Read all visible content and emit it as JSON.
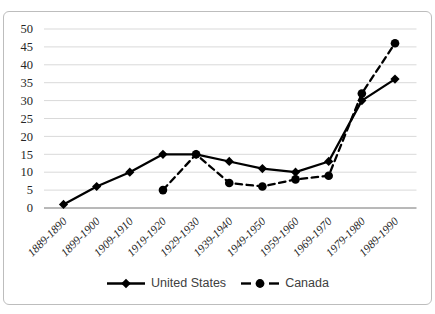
{
  "figure": {
    "background_color": "#ffffff",
    "border_color": "#bdbdbd"
  },
  "chart_data": {
    "type": "line",
    "title": "",
    "xlabel": "",
    "ylabel": "",
    "categories": [
      "1889-1890",
      "1899-1900",
      "1909-1910",
      "1919-1920",
      "1929-1930",
      "1939-1940",
      "1949-1950",
      "1959-1960",
      "1969-1970",
      "1979-1980",
      "1989-1990"
    ],
    "series": [
      {
        "name": "United States",
        "line_style": "solid",
        "marker": "diamond",
        "color": "#000000",
        "values": [
          1,
          6,
          10,
          15,
          15,
          13,
          11,
          10,
          13,
          30,
          36
        ]
      },
      {
        "name": "Canada",
        "line_style": "dashed",
        "marker": "circle",
        "color": "#000000",
        "values": [
          null,
          null,
          null,
          5,
          15,
          7,
          6,
          8,
          9,
          32,
          46
        ]
      }
    ],
    "ylim": [
      0,
      50
    ],
    "y_tick_step": 5,
    "y_tick_labels": [
      "0",
      "5",
      "10",
      "15",
      "20",
      "25",
      "30",
      "35",
      "40",
      "45",
      "50"
    ],
    "grid": "horizontal",
    "gridline_color": "#d9d9d9",
    "axis_line_color": "#737373",
    "tick_label_color": "#262626",
    "legend": {
      "position": "bottom",
      "entries": [
        "United States",
        "Canada"
      ],
      "text_color": "#404040"
    }
  }
}
